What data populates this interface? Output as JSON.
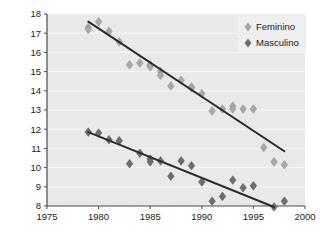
{
  "chart_data": {
    "type": "scatter",
    "title": "",
    "subtitle": "",
    "xlabel": "",
    "ylabel": "",
    "xlim": [
      1975,
      2000
    ],
    "ylim": [
      8,
      18
    ],
    "xticks": [
      1975,
      1980,
      1985,
      1990,
      1995,
      2000
    ],
    "yticks": [
      8,
      9,
      10,
      11,
      12,
      13,
      14,
      15,
      16,
      17,
      18
    ],
    "grid": true,
    "legend_position": "top-right",
    "marker": "diamond",
    "series": [
      {
        "name": "Feminino",
        "color": "#a8a8a8",
        "trendline": true,
        "trendline_color": "#2b2b2b",
        "trendline_start": [
          1979,
          17.6
        ],
        "trendline_end": [
          1998,
          10.85
        ],
        "x": [
          1979,
          1979,
          1980,
          1981,
          1982,
          1983,
          1984,
          1985,
          1985,
          1986,
          1986,
          1987,
          1988,
          1989,
          1989,
          1990,
          1991,
          1992,
          1993,
          1993,
          1994,
          1995,
          1996,
          1997,
          1998
        ],
        "y": [
          17.3,
          17.2,
          17.6,
          17.1,
          16.55,
          15.35,
          15.45,
          15.35,
          15.25,
          15.0,
          14.8,
          14.25,
          14.55,
          14.2,
          14.15,
          13.85,
          12.95,
          13.05,
          13.2,
          13.05,
          13.05,
          13.05,
          11.05,
          10.3,
          10.15
        ]
      },
      {
        "name": "Masculino",
        "color": "#6e6e6e",
        "trendline": true,
        "trendline_color": "#2b2b2b",
        "trendline_start": [
          1979,
          11.85
        ],
        "trendline_end": [
          1997,
          7.95
        ],
        "x": [
          1979,
          1980,
          1981,
          1982,
          1983,
          1984,
          1985,
          1985,
          1986,
          1987,
          1988,
          1989,
          1990,
          1991,
          1992,
          1993,
          1994,
          1995,
          1997,
          1998
        ],
        "y": [
          11.85,
          11.8,
          11.45,
          11.4,
          10.2,
          10.75,
          10.45,
          10.3,
          10.35,
          9.55,
          10.35,
          10.1,
          9.25,
          8.25,
          8.5,
          9.35,
          8.95,
          9.05,
          7.95,
          8.25
        ]
      }
    ]
  },
  "axes": {
    "x_tick_labels": [
      "1975",
      "1980",
      "1985",
      "1990",
      "1995",
      "2000"
    ],
    "y_tick_labels": [
      "8",
      "9",
      "10",
      "11",
      "12",
      "13",
      "14",
      "15",
      "16",
      "17",
      "18"
    ]
  },
  "legend": {
    "items": [
      {
        "label": "Feminino",
        "marker_color": "#a8a8a8",
        "marker": "diamond"
      },
      {
        "label": "Masculino",
        "marker_color": "#6e6e6e",
        "marker": "diamond"
      }
    ]
  },
  "colors": {
    "plot_background": "#e9e9e9",
    "page_background": "#ffffff",
    "gridline": "#f7f7f7",
    "axis": "#4a4a4a",
    "trendline": "#2b2b2b",
    "feminino_marker": "#a8a8a8",
    "masculino_marker": "#6e6e6e"
  }
}
